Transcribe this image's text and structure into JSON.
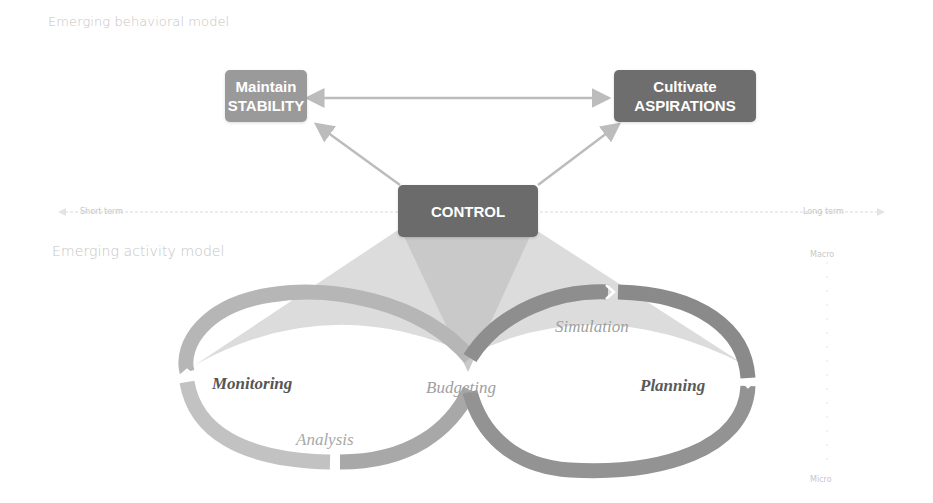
{
  "sections": {
    "behavioral_title": "Emerging behavioral model",
    "activity_title": "Emerging activity model"
  },
  "boxes": {
    "stability": {
      "line1": "Maintain",
      "line2": "STABILITY",
      "color": "#999999"
    },
    "aspirations": {
      "line1": "Cultivate",
      "line2": "ASPIRATIONS",
      "color": "#6e6e6e"
    },
    "control": {
      "label": "CONTROL",
      "color": "#6b6b6b"
    }
  },
  "timeline": {
    "left_label": "Short term",
    "right_label": "Long term"
  },
  "scale": {
    "top_label": "Macro",
    "bottom_label": "Micro"
  },
  "cycle": {
    "left_loop": {
      "main": "Monitoring",
      "sub": "Analysis"
    },
    "center": "Budgeting",
    "right_loop": {
      "main": "Planning",
      "sub": "Simulation"
    }
  },
  "colors": {
    "dark_box": "#6b6b6b",
    "light_box": "#999999",
    "arrow": "#bcbcbc",
    "left_loop": "#b8b8b8",
    "right_loop": "#8c8c8c",
    "cone": "#d4d4d4",
    "muted_text": "#c4c4c4"
  }
}
